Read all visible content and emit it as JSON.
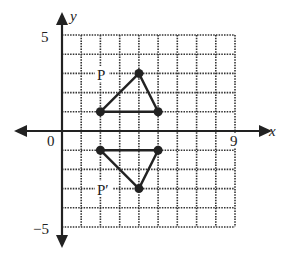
{
  "diagram": {
    "type": "coordinate-grid-reflection",
    "axes": {
      "x_label": "x",
      "y_label": "y",
      "origin_label": "0",
      "x_max_label": "9",
      "y_max_label": "5",
      "y_min_label": "−5",
      "x_range": [
        0,
        9
      ],
      "y_range": [
        -5,
        5
      ]
    },
    "figures": [
      {
        "label": "P",
        "vertices": [
          [
            2,
            1
          ],
          [
            4,
            3
          ],
          [
            5,
            1
          ]
        ]
      },
      {
        "label": "P′",
        "vertices": [
          [
            2,
            -1
          ],
          [
            4,
            -3
          ],
          [
            5,
            -1
          ]
        ]
      }
    ],
    "colors": {
      "ink": "#222222",
      "grid": "#333333",
      "background": "#ffffff"
    }
  }
}
